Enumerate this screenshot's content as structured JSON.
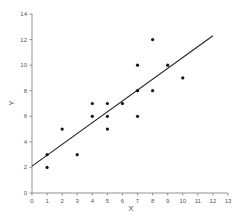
{
  "chart_data": {
    "type": "scatter",
    "title": "",
    "xlabel": "X",
    "ylabel": "Y",
    "xlim": [
      0,
      13
    ],
    "ylim": [
      0,
      14
    ],
    "x_ticks": [
      0,
      1,
      2,
      3,
      4,
      5,
      6,
      7,
      8,
      9,
      10,
      11,
      12,
      13
    ],
    "y_ticks": [
      0,
      2,
      4,
      6,
      8,
      10,
      12,
      14
    ],
    "grid": false,
    "legend": null,
    "series": [
      {
        "name": "data",
        "marker": "dot",
        "color": "#111111",
        "points": [
          [
            1,
            2
          ],
          [
            1,
            3
          ],
          [
            2,
            5
          ],
          [
            3,
            3
          ],
          [
            4,
            6
          ],
          [
            4,
            7
          ],
          [
            5,
            5
          ],
          [
            5,
            6
          ],
          [
            5,
            7
          ],
          [
            6,
            7
          ],
          [
            7,
            6
          ],
          [
            7,
            8
          ],
          [
            7,
            10
          ],
          [
            8,
            8
          ],
          [
            8,
            12
          ],
          [
            9,
            10
          ],
          [
            10,
            9
          ]
        ]
      }
    ],
    "trendline": {
      "type": "linear",
      "color": "#222222",
      "intercept": 2.1,
      "slope": 0.85,
      "x_range": [
        0,
        12
      ]
    }
  }
}
